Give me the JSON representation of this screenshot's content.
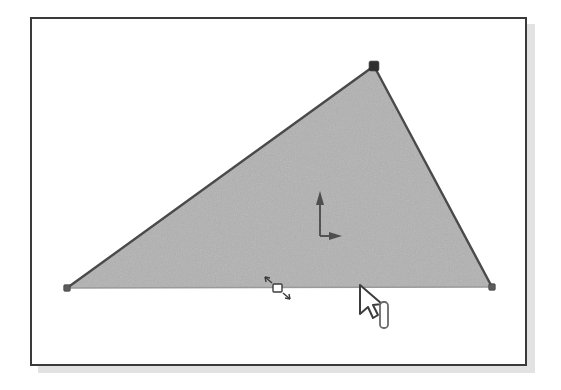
{
  "figure": {
    "kind": "graphics-editor-canvas-screenshot",
    "caption": "",
    "background_color": "#ffffff"
  },
  "window": {
    "name": "drawing-canvas-window",
    "border_color": "#3a3a3a",
    "border_width": 2,
    "fill_color": "#ffffff",
    "shadow_color": "#e2e2e2",
    "bounds": {
      "x": 30,
      "y": 17,
      "width": 497,
      "height": 349
    }
  },
  "canvas": {
    "name": "drawing-canvas",
    "width": 497,
    "height": 349
  },
  "shape": {
    "name": "triangle-shape",
    "type": "triangle",
    "fill_color": "#a9a9a9",
    "stroke_color": "#4a4a4a",
    "stroke_width": 2,
    "selected": true,
    "vertices": [
      {
        "label": "vertex-left",
        "x": 35,
        "y": 269
      },
      {
        "label": "vertex-apex",
        "x": 342,
        "y": 47
      },
      {
        "label": "vertex-right",
        "x": 460,
        "y": 268
      }
    ],
    "base_edge": {
      "label": "base-edge",
      "from": {
        "x": 35,
        "y": 269
      },
      "to": {
        "x": 460,
        "y": 268
      },
      "stroke_color": "#9a9a9a",
      "stroke_width": 1.6
    }
  },
  "handles": {
    "vertex_handle_color": "#4a4a4a",
    "vertex_handle_size": 5,
    "items": [
      {
        "name": "vertex-handle-left",
        "x": 35,
        "y": 269,
        "size": 4
      },
      {
        "name": "vertex-handle-apex",
        "x": 342,
        "y": 47,
        "size": 6
      },
      {
        "name": "vertex-handle-right",
        "x": 460,
        "y": 268,
        "size": 4
      }
    ]
  },
  "axis_gizmo": {
    "name": "axis-gizmo",
    "origin": {
      "x": 288,
      "y": 217
    },
    "color": "#4e4e4e",
    "y_axis": {
      "label": "y-axis-arrow",
      "direction": "up",
      "length": 45
    },
    "x_axis": {
      "label": "x-axis-arrow",
      "direction": "right",
      "length": 22
    }
  },
  "edge_handle": {
    "name": "edge-midpoint-handle",
    "x": 245,
    "y": 269,
    "color": "#3d3d3d",
    "style": "diagonal-double-arrow"
  },
  "pointer": {
    "name": "mouse-cursor",
    "tip": {
      "x": 328,
      "y": 266
    },
    "fill_color": "#ffffff",
    "stroke_color": "#3d3d3d"
  },
  "scale_widget": {
    "name": "scale-bar-widget",
    "x": 348,
    "y": 283,
    "width": 8,
    "height": 26,
    "stroke_color": "#6a6a6a",
    "fill_color": "#ffffff"
  }
}
